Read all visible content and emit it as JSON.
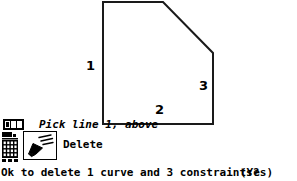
{
  "canvas": {
    "shape": {
      "name": "beveled-rectangle-sketch",
      "stroke_color": "#1a1a1a",
      "fill_color": "#ffffff",
      "points": "103,2 163,2 213,53 213,124 103,124",
      "edges": [
        {
          "id": "1",
          "label": "1",
          "role": "left-vertical-edge"
        },
        {
          "id": "2",
          "label": "2",
          "role": "bottom-horizontal-edge"
        },
        {
          "id": "3",
          "label": "3",
          "role": "right-vertical-edge"
        }
      ]
    }
  },
  "prompt": {
    "text": "Pick line 1, above",
    "mouse_icon": "mouse-left-button-icon",
    "mouse_buttons": [
      true,
      false,
      false
    ]
  },
  "tool": {
    "icon": "eraser-delete-icon",
    "label": "Delete",
    "keypad_icon": "keypad-grid-icon"
  },
  "confirm": {
    "text": "Ok to delete 1 curve and 3 constraints?",
    "answer": "(Yes)",
    "mouse_icon": "mouse-middle-button-icon",
    "mouse_buttons": [
      false,
      true,
      false
    ]
  }
}
